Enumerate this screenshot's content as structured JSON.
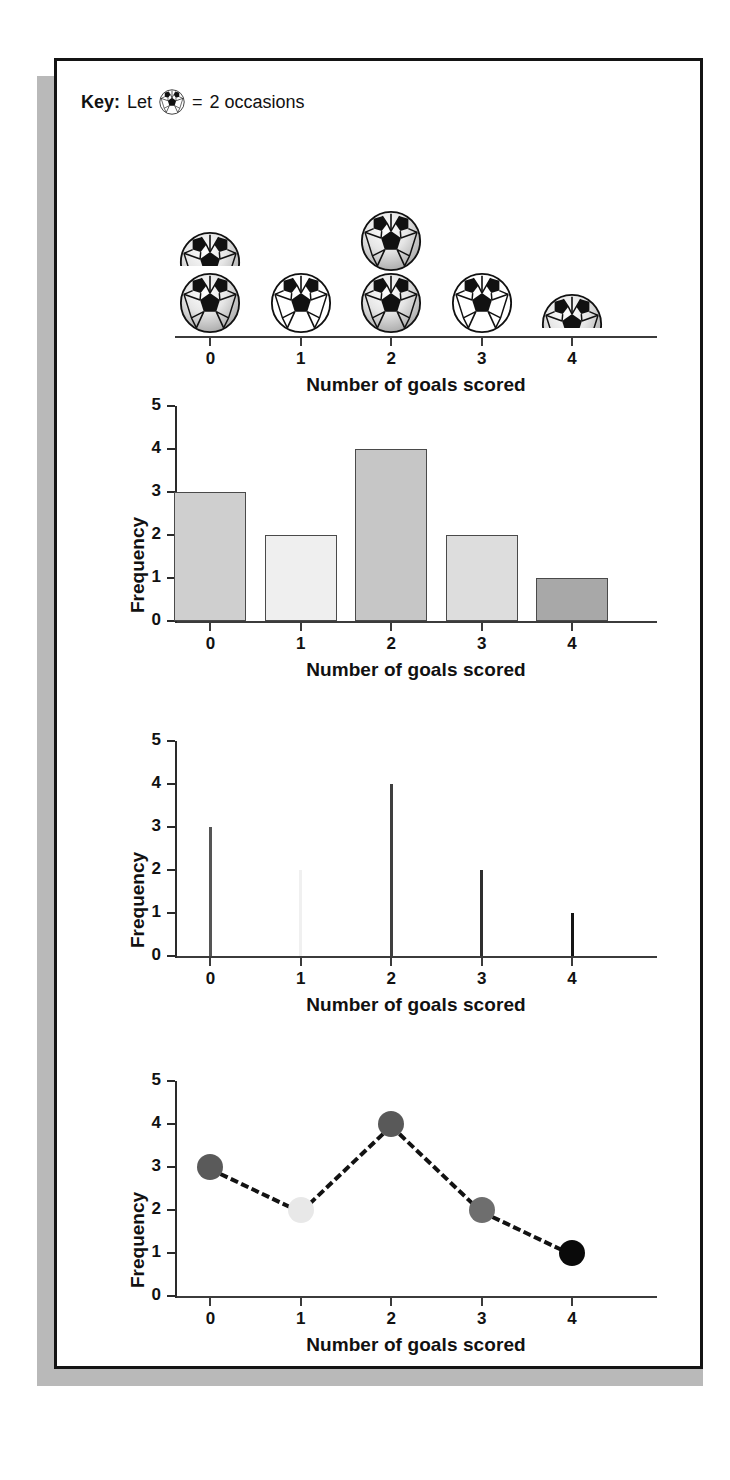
{
  "key": {
    "prefix": "Key:",
    "let": "Let",
    "icon": "soccer-ball-icon",
    "equals": "=",
    "value": "2 occasions"
  },
  "axis_title_x": "Number of goals scored",
  "axis_title_y": "Frequency",
  "categories": [
    "0",
    "1",
    "2",
    "3",
    "4"
  ],
  "y_ticks": [
    "0",
    "1",
    "2",
    "3",
    "4",
    "5"
  ],
  "chart_data": [
    {
      "type": "pictogram",
      "title": "",
      "xlabel": "Number of goals scored",
      "ylabel": "",
      "categories": [
        "0",
        "1",
        "2",
        "3",
        "4"
      ],
      "values": [
        3,
        2,
        4,
        2,
        1
      ],
      "icon_unit": 2,
      "icons_per_category": [
        1.5,
        1,
        2,
        1,
        0.5
      ],
      "key_text": "Let one ball = 2 occasions",
      "grid": false,
      "legend": "none"
    },
    {
      "type": "bar",
      "title": "",
      "xlabel": "Number of goals scored",
      "ylabel": "Frequency",
      "categories": [
        "0",
        "1",
        "2",
        "3",
        "4"
      ],
      "values": [
        3,
        2,
        4,
        2,
        1
      ],
      "ylim": [
        0,
        5
      ],
      "yticks": [
        0,
        1,
        2,
        3,
        4,
        5
      ],
      "bar_colors": [
        "#cfcfcf",
        "#efefef",
        "#c6c6c6",
        "#dddddd",
        "#a8a8a8"
      ],
      "bar_edge_color": "#4a4a4a",
      "grid": false,
      "legend": "none"
    },
    {
      "type": "vertical-line",
      "title": "",
      "xlabel": "Number of goals scored",
      "ylabel": "Frequency",
      "categories": [
        "0",
        "1",
        "2",
        "3",
        "4"
      ],
      "values": [
        3,
        2,
        4,
        2,
        1
      ],
      "ylim": [
        0,
        5
      ],
      "yticks": [
        0,
        1,
        2,
        3,
        4,
        5
      ],
      "line_colors": [
        "#555555",
        "#f0f0f0",
        "#3f3f3f",
        "#2f2f2f",
        "#151515"
      ],
      "grid": false,
      "legend": "none"
    },
    {
      "type": "line",
      "title": "",
      "xlabel": "Number of goals scored",
      "ylabel": "Frequency",
      "categories": [
        "0",
        "1",
        "2",
        "3",
        "4"
      ],
      "values": [
        3,
        2,
        4,
        2,
        1
      ],
      "ylim": [
        0,
        5
      ],
      "yticks": [
        0,
        1,
        2,
        3,
        4,
        5
      ],
      "marker_colors": [
        "#5a5a5a",
        "#e8e8e8",
        "#595959",
        "#6e6e6e",
        "#0a0a0a"
      ],
      "line_style": "dashed",
      "line_color": "#121212",
      "grid": false,
      "legend": "none"
    }
  ],
  "colors": {
    "frame": "#141414",
    "shadow": "#b9b9b9",
    "axis": "#3b3b3b",
    "text": "#111111"
  }
}
